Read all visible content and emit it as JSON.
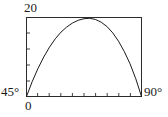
{
  "figure": {
    "labels": {
      "y_max": "20",
      "x_min": "45°",
      "x_max": "90°",
      "origin": "0"
    }
  },
  "chart_data": {
    "type": "line",
    "title": "",
    "xlabel": "",
    "ylabel": "",
    "xlim": [
      45,
      90
    ],
    "ylim": [
      0,
      20
    ],
    "x_tick_labels": [
      "45°",
      "90°"
    ],
    "y_tick_labels": [
      "0",
      "20"
    ],
    "grid": false,
    "legend": "none",
    "axis_ticks": {
      "y_interior_count": 4,
      "x_interior_count": 9
    },
    "series": [
      {
        "name": "curve",
        "x": [
          45,
          47.25,
          49.5,
          51.75,
          54,
          56.25,
          58.5,
          60.75,
          63,
          65.25,
          67.5,
          69.75,
          72,
          74.25,
          76.5,
          78.75,
          81,
          83.25,
          85.5,
          87.75,
          90
        ],
        "y": [
          0,
          3.8,
          7.1,
          10.0,
          12.5,
          14.6,
          16.3,
          17.6,
          18.6,
          19.3,
          19.7,
          19.8,
          19.5,
          18.8,
          17.7,
          16.1,
          14.0,
          11.4,
          8.3,
          4.5,
          0
        ]
      }
    ]
  }
}
